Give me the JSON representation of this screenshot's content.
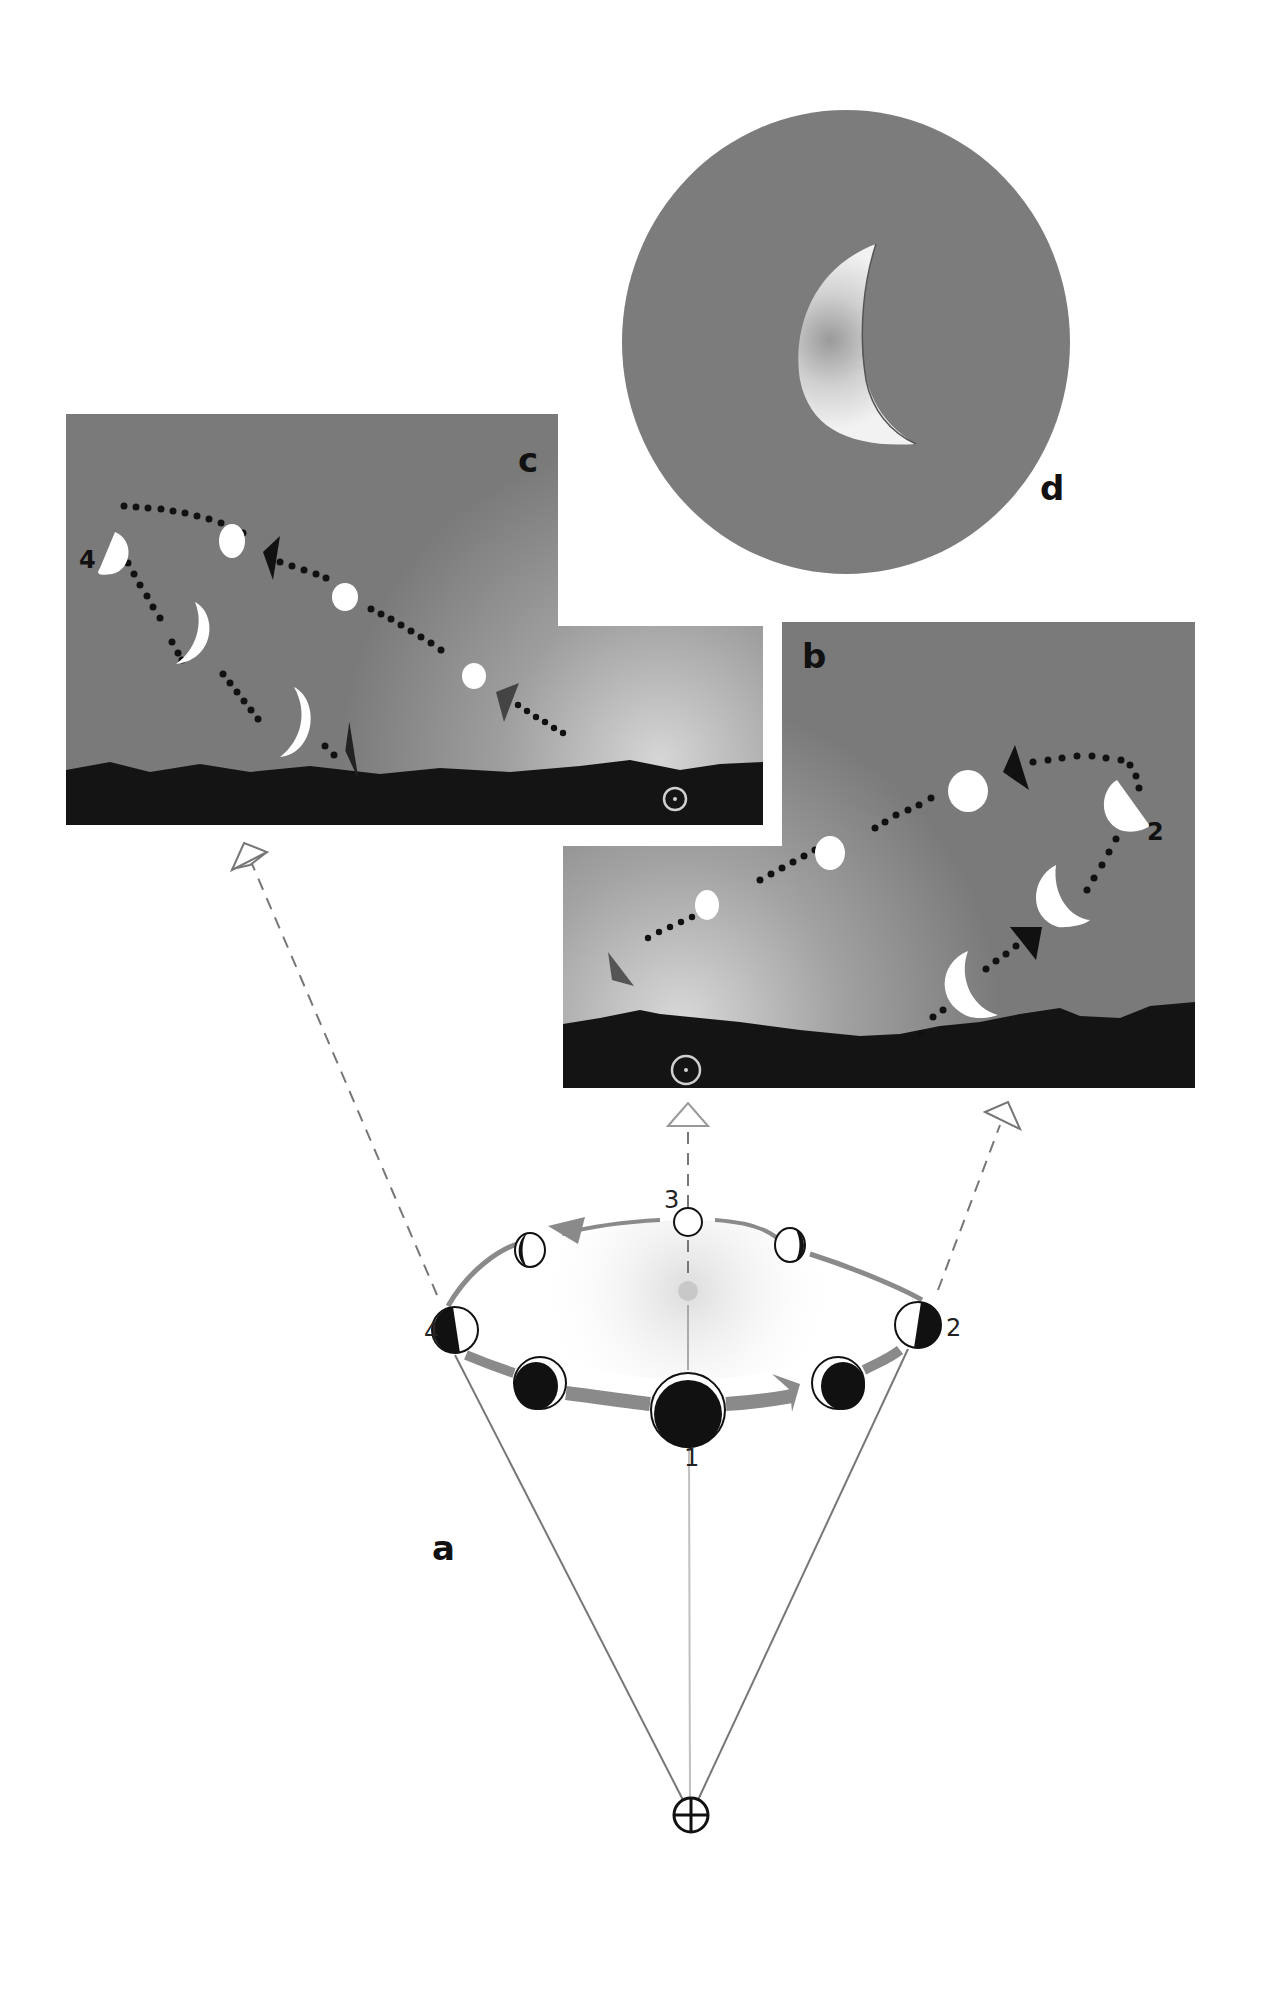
{
  "figure": {
    "panels": {
      "a": {
        "label": "a",
        "description": "Moon orbit around Earth viewed from above with phases"
      },
      "b": {
        "label": "b",
        "description": "Evening sky view: Moon phases moving across the sky"
      },
      "c": {
        "label": "c",
        "description": "Morning sky view: Moon phases moving across the sky"
      },
      "d": {
        "label": "d",
        "description": "Close-up of a crescent Moon"
      }
    },
    "orbit_labels": {
      "new": "1",
      "first_quarter": "2",
      "full": "3",
      "last_quarter": "4"
    },
    "sky_labels": {
      "b_quarter": "2",
      "c_quarter": "4"
    },
    "symbols": {
      "earth": "earth-symbol",
      "sun": "sun-symbol"
    },
    "colors": {
      "sky_dark": "#7a7a7a",
      "sky_glow": "#c8c8c8",
      "horizon": "#141414",
      "moon_disc": "#ffffff",
      "orbit_track": "#8a8a8a",
      "dashed_line": "#777777",
      "sight_line": "#666666",
      "path_dots": "#111111",
      "circle_d_bg": "#7c7c7c"
    }
  }
}
